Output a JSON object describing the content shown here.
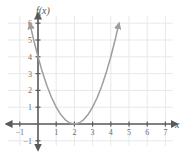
{
  "chart_data": {
    "type": "line",
    "title": "",
    "xlabel": "x",
    "ylabel": "f(x)",
    "function_label": "f(x)",
    "expression": "f(x) = (x - 2)^2",
    "xlim": [
      -1.5,
      7.5
    ],
    "ylim": [
      -1.5,
      6.5
    ],
    "grid": true,
    "legend": "none",
    "x_ticks": [
      -1,
      1,
      2,
      3,
      4,
      5,
      6,
      7
    ],
    "x_tick_labels": [
      "−1",
      "1",
      "2",
      "3",
      "4",
      "5",
      "6",
      "7"
    ],
    "y_ticks": [
      -1,
      1,
      2,
      3,
      4,
      5,
      6
    ],
    "y_tick_labels": [
      "−1",
      "1",
      "2",
      "3",
      "4",
      "5",
      "6"
    ],
    "vertex": [
      2,
      0
    ],
    "y_intercept": [
      0,
      4
    ],
    "x_intercept": [
      2,
      0
    ],
    "curve_color": "#9e9e9e",
    "axis_color": "#5a5a5a",
    "grid_color": "#e8e8e8",
    "label_color": "#6d6d6d",
    "points": [
      {
        "x": -0.45,
        "y": 6.0
      },
      {
        "x": -0.25,
        "y": 5.06
      },
      {
        "x": 0.0,
        "y": 4.0
      },
      {
        "x": 0.25,
        "y": 3.06
      },
      {
        "x": 0.5,
        "y": 2.25
      },
      {
        "x": 0.75,
        "y": 1.56
      },
      {
        "x": 1.0,
        "y": 1.0
      },
      {
        "x": 1.25,
        "y": 0.56
      },
      {
        "x": 1.5,
        "y": 0.25
      },
      {
        "x": 1.75,
        "y": 0.06
      },
      {
        "x": 2.0,
        "y": 0.0
      },
      {
        "x": 2.25,
        "y": 0.06
      },
      {
        "x": 2.5,
        "y": 0.25
      },
      {
        "x": 2.75,
        "y": 0.56
      },
      {
        "x": 3.0,
        "y": 1.0
      },
      {
        "x": 3.25,
        "y": 1.56
      },
      {
        "x": 3.5,
        "y": 2.25
      },
      {
        "x": 3.75,
        "y": 3.06
      },
      {
        "x": 4.0,
        "y": 4.0
      },
      {
        "x": 4.25,
        "y": 5.06
      },
      {
        "x": 4.45,
        "y": 6.0
      }
    ],
    "arrows": [
      {
        "name": "curve-left-arrow",
        "x": -0.45,
        "y": 6.0
      },
      {
        "name": "curve-right-arrow",
        "x": 4.45,
        "y": 6.0
      },
      {
        "name": "x-axis-right-arrow",
        "x": 7.6,
        "y": 0
      },
      {
        "name": "x-axis-left-arrow",
        "x": -1.7,
        "y": 0
      },
      {
        "name": "y-axis-up-arrow",
        "x": 0,
        "y": 6.55
      },
      {
        "name": "y-axis-down-arrow",
        "x": 0,
        "y": -1.6
      }
    ]
  }
}
